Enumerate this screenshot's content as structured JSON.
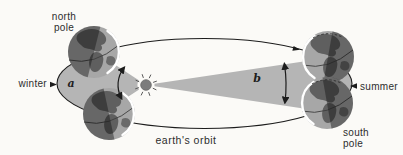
{
  "diagram": {
    "labels": {
      "north_pole": {
        "line1": "north",
        "line2": "pole"
      },
      "winter": "winter",
      "summer": "summer",
      "south_pole": {
        "line1": "south",
        "line2": "pole"
      },
      "orbit": "earth's orbit",
      "angle_a": "a",
      "angle_b": "b"
    },
    "colors": {
      "background": "#fbfaf7",
      "swept_area": "#b5b5b5",
      "line": "#1c1c1c",
      "sun": "#7c7c7c",
      "globe_ocean": "#a7a7a7",
      "globe_land": "#5f5f5f",
      "text": "#2d2d2d"
    }
  }
}
